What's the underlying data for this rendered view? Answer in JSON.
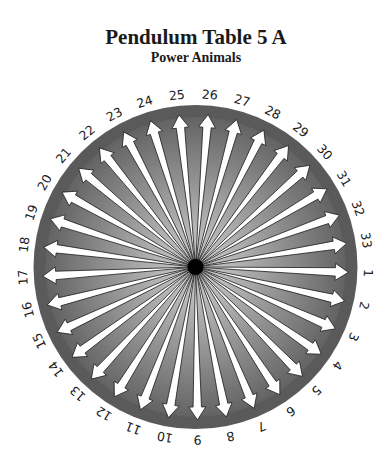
{
  "header": {
    "title": "Pendulum Table 5 A",
    "subtitle": "Power Animals"
  },
  "wheel": {
    "center": [
      195.5,
      267
    ],
    "radius": 162,
    "label_radius": 173,
    "count": 33,
    "start_angle_deg": 2,
    "direction": "clockwise",
    "labels": [
      "1",
      "2",
      "3",
      "4",
      "5",
      "6",
      "7",
      "8",
      "9",
      "10",
      "11",
      "12",
      "13",
      "14",
      "15",
      "16",
      "17",
      "18",
      "19",
      "20",
      "21",
      "22",
      "23",
      "24",
      "25",
      "26",
      "27",
      "28",
      "29",
      "30",
      "31",
      "32",
      "33"
    ],
    "colors": {
      "rim": "#5a5a5a",
      "wedge_inner": "#b4b4b4",
      "wedge_outer": "#5c5c5c",
      "arrow_fill": "#ffffff",
      "arrow_stroke": "#1a1a1a",
      "hub": "#000000",
      "label": "#1a1a1a"
    },
    "icons": {
      "arrow": "arrow-outward-icon",
      "hub": "center-dot-icon"
    }
  }
}
